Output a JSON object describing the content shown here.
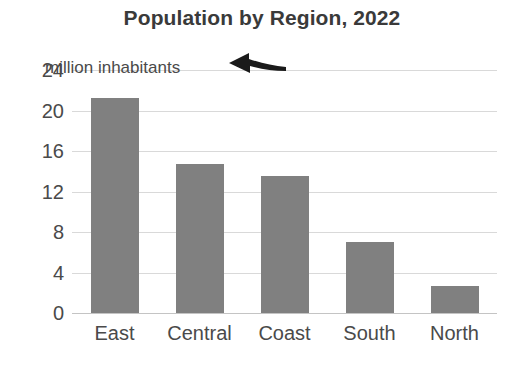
{
  "chart_data": {
    "type": "bar",
    "title": "Population by Region, 2022",
    "xlabel": "",
    "ylabel": "",
    "unit_note": "million inhabitants",
    "categories": [
      "East",
      "Central",
      "Coast",
      "South",
      "North"
    ],
    "values": [
      21.2,
      14.7,
      13.5,
      7.0,
      2.7
    ],
    "yticks": [
      0,
      4,
      8,
      12,
      16,
      20,
      24
    ],
    "ylim": [
      0,
      24
    ],
    "grid": true,
    "legend": "none",
    "bar_color": "#808080",
    "annotations": [
      {
        "text": "million inhabitants",
        "attached_to_tick": "24",
        "arrow": "left-arrow-icon"
      }
    ]
  },
  "axis": {
    "y_tick_labels": [
      "24",
      "20",
      "16",
      "12",
      "8",
      "4",
      "0"
    ],
    "x_tick_labels": [
      "East",
      "Central",
      "Coast",
      "South",
      "North"
    ]
  },
  "colors": {
    "bar": "#808080",
    "grid": "#d9d9d9",
    "baseline": "#c4c4c4",
    "title_text": "#3a3a3a",
    "tick_text": "#4a4a4a",
    "arrow": "#1a1a1a",
    "background": "#ffffff"
  }
}
